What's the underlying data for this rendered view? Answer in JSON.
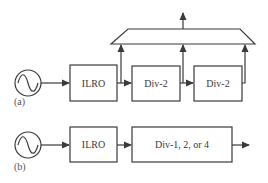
{
  "diagram": {
    "colors": {
      "stroke": "#3a3a3a",
      "background": "#ffffff"
    },
    "panel_a": {
      "tag": "(a)",
      "source_icon": "sine-source-icon",
      "blocks": [
        {
          "id": "ilro",
          "label": "ILRO"
        },
        {
          "id": "div2_1",
          "label": "Div-2"
        },
        {
          "id": "div2_2",
          "label": "Div-2"
        }
      ],
      "mux": "trapezoid-combiner"
    },
    "panel_b": {
      "tag": "(b)",
      "source_icon": "sine-source-icon",
      "blocks": [
        {
          "id": "ilro",
          "label": "ILRO"
        },
        {
          "id": "div_sel",
          "label": "Div-1, 2, or 4"
        }
      ]
    }
  }
}
